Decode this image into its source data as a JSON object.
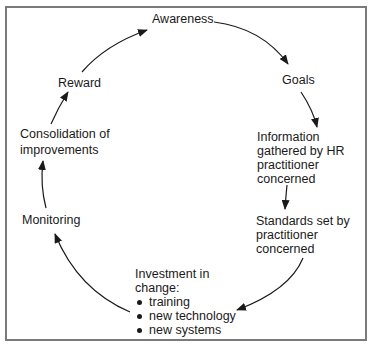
{
  "diagram": {
    "type": "cycle",
    "nodes": [
      {
        "id": "awareness",
        "lines": [
          "Awareness"
        ]
      },
      {
        "id": "goals",
        "lines": [
          "Goals"
        ]
      },
      {
        "id": "information",
        "lines": [
          "Information",
          "gathered by HR",
          "practitioner",
          "concerned"
        ]
      },
      {
        "id": "standards",
        "lines": [
          "Standards set by",
          "practitioner",
          "concerned"
        ]
      },
      {
        "id": "investment",
        "lines": [
          "Investment in",
          "change:"
        ],
        "bullets": [
          "training",
          "new technology",
          "new systems"
        ]
      },
      {
        "id": "monitoring",
        "lines": [
          "Monitoring"
        ]
      },
      {
        "id": "consolidation",
        "lines": [
          "Consolidation of",
          "improvements"
        ]
      },
      {
        "id": "reward",
        "lines": [
          "Reward"
        ]
      }
    ],
    "edges": [
      {
        "from": "awareness",
        "to": "goals"
      },
      {
        "from": "goals",
        "to": "information"
      },
      {
        "from": "information",
        "to": "standards"
      },
      {
        "from": "standards",
        "to": "investment"
      },
      {
        "from": "investment",
        "to": "monitoring"
      },
      {
        "from": "monitoring",
        "to": "consolidation"
      },
      {
        "from": "consolidation",
        "to": "reward"
      },
      {
        "from": "reward",
        "to": "awareness"
      }
    ],
    "colors": {
      "text": "#1a1a1a",
      "arrow": "#1a1a1a",
      "frame": "#7a7a7a",
      "background": "#ffffff"
    }
  }
}
